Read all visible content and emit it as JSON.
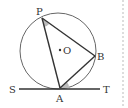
{
  "diagram": {
    "type": "geometry",
    "labels": {
      "P": "P",
      "O": "O",
      "B": "B",
      "A": "A",
      "S": "S",
      "T": "T"
    },
    "points": {
      "P": [
        42,
        18
      ],
      "B": [
        95,
        56
      ],
      "A": [
        60,
        88
      ],
      "O": [
        60,
        50
      ]
    },
    "circle": {
      "cx": 58,
      "cy": 51,
      "r": 38
    },
    "tangent_line": {
      "from": "S",
      "to": "T",
      "through": "A"
    },
    "marked_angles": [
      "angle APB",
      "angle BAT"
    ],
    "colors": {
      "stroke": "#333333",
      "circle": "#666666",
      "angle_fill": "#bbbbbb",
      "dashed": "#bbbbbb"
    }
  }
}
